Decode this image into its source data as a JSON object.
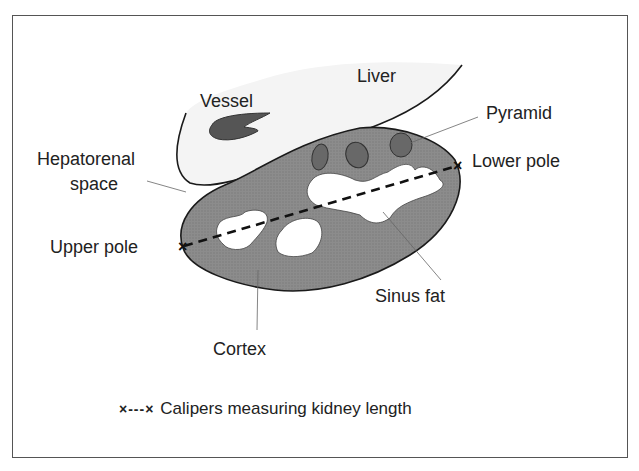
{
  "diagram": {
    "type": "anatomical-ultrasound-schematic",
    "labels": {
      "liver": "Liver",
      "vessel": "Vessel",
      "pyramid": "Pyramid",
      "hepatorenal_line1": "Hepatorenal",
      "hepatorenal_line2": "space",
      "lower_pole": "Lower pole",
      "upper_pole": "Upper pole",
      "sinus_fat": "Sinus fat",
      "cortex": "Cortex"
    },
    "legend": {
      "symbol": "×---×",
      "text": "Calipers measuring kidney length"
    },
    "colors": {
      "cortex_fill": "#8a8a8a",
      "pyramid_fill": "#6a6a6a",
      "vessel_fill": "#555555",
      "liver_fill": "#f4f4f4",
      "sinus_fat_fill": "#ffffff",
      "outline": "#1a1a1a"
    }
  }
}
